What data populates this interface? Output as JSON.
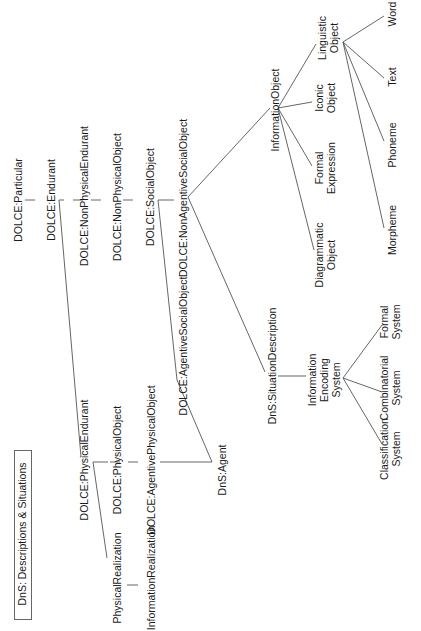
{
  "title": "DnS: Descriptions & Situations",
  "nodes": {
    "particular": "DOLCE:Particular",
    "endurant": "DOLCE:Endurant",
    "nonphysical_endurant": "DOLCE:NonPhysicalEndurant",
    "nonphysical_object": "DOLCE:NonPhysicalObject",
    "social_object": "DOLCE:SocialObject",
    "nonagentive_social_object": "DOLCE:NonAgentiveSocialObject",
    "agentive_social_object": "DOLCE:AgentiveSocialObject",
    "physical_endurant": "DOLCE:PhysicalEndurant",
    "physical_object": "DOLCE:PhysicalObject",
    "agentive_physical_object": "DOLCE:AgentivePhysicalObject",
    "physical_realization": "PhysicalRealization",
    "information_realization": "InformationRealization",
    "agent": "DnS:Agent",
    "situation_description": "DnS:SituationDescription",
    "information_object": "InformationObject",
    "diagrammatic_object": [
      "Diagrammatic",
      "Object"
    ],
    "formal_expression": [
      "Formal",
      "Expression"
    ],
    "iconic_object": [
      "Iconic",
      "Object"
    ],
    "linguistic_object": [
      "Linguistic",
      "Object"
    ],
    "morpheme": "Morpheme",
    "phoneme": "Phoneme",
    "text": "Text",
    "word": "Word",
    "information_encoding_system": [
      "Information",
      "Encoding",
      "System"
    ],
    "classification_system": [
      "Classification",
      "System"
    ],
    "combinatorial_system": [
      "Combinatorial",
      "System"
    ],
    "formal_system": [
      "Formal",
      "System"
    ]
  },
  "edges": [
    {
      "from": "DOLCE:Particular",
      "to": "DOLCE:Endurant",
      "style": "dashed"
    },
    {
      "from": "DOLCE:Endurant",
      "to": "DOLCE:NonPhysicalEndurant",
      "style": "dashed"
    },
    {
      "from": "DOLCE:NonPhysicalEndurant",
      "to": "DOLCE:NonPhysicalObject",
      "style": "dashed"
    },
    {
      "from": "DOLCE:NonPhysicalObject",
      "to": "DOLCE:SocialObject",
      "style": "dashed"
    },
    {
      "from": "DOLCE:SocialObject",
      "to": "DOLCE:NonAgentiveSocialObject",
      "style": "dashed"
    },
    {
      "from": "DOLCE:SocialObject",
      "to": "DOLCE:AgentiveSocialObject",
      "style": "solid"
    },
    {
      "from": "DOLCE:Endurant",
      "to": "DOLCE:PhysicalEndurant",
      "style": "solid"
    },
    {
      "from": "DOLCE:PhysicalEndurant",
      "to": "DOLCE:PhysicalObject",
      "style": "dashed"
    },
    {
      "from": "DOLCE:PhysicalObject",
      "to": "DOLCE:AgentivePhysicalObject",
      "style": "dashed"
    },
    {
      "from": "DOLCE:PhysicalEndurant",
      "to": "PhysicalRealization",
      "style": "solid"
    },
    {
      "from": "PhysicalRealization",
      "to": "InformationRealization",
      "style": "solid"
    },
    {
      "from": "DOLCE:AgentivePhysicalObject",
      "to": "DnS:Agent",
      "style": "solid"
    },
    {
      "from": "DOLCE:AgentiveSocialObject",
      "to": "DnS:Agent",
      "style": "solid"
    },
    {
      "from": "DOLCE:NonAgentiveSocialObject",
      "to": "InformationObject",
      "style": "solid"
    },
    {
      "from": "DOLCE:NonAgentiveSocialObject",
      "to": "DnS:SituationDescription",
      "style": "solid"
    },
    {
      "from": "InformationObject",
      "to": "Diagrammatic Object",
      "style": "solid"
    },
    {
      "from": "InformationObject",
      "to": "Formal Expression",
      "style": "solid"
    },
    {
      "from": "InformationObject",
      "to": "Iconic Object",
      "style": "solid"
    },
    {
      "from": "InformationObject",
      "to": "Linguistic Object",
      "style": "solid"
    },
    {
      "from": "Linguistic Object",
      "to": "Morpheme",
      "style": "solid"
    },
    {
      "from": "Linguistic Object",
      "to": "Phoneme",
      "style": "solid"
    },
    {
      "from": "Linguistic Object",
      "to": "Text",
      "style": "solid"
    },
    {
      "from": "Linguistic Object",
      "to": "Word",
      "style": "solid"
    },
    {
      "from": "DnS:SituationDescription",
      "to": "Information Encoding System",
      "style": "solid"
    },
    {
      "from": "Information Encoding System",
      "to": "Classification System",
      "style": "solid"
    },
    {
      "from": "Information Encoding System",
      "to": "Combinatorial System",
      "style": "solid"
    },
    {
      "from": "Information Encoding System",
      "to": "Formal System",
      "style": "solid"
    }
  ]
}
